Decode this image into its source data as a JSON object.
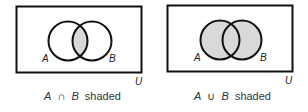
{
  "figure": {
    "shade_color": "#d9d9d9",
    "stroke_color": "#111111",
    "panels": [
      {
        "id": "intersection",
        "set_a_label": "A",
        "set_b_label": "B",
        "universe_label": "U",
        "caption_set_a": "A",
        "caption_operator": "∩",
        "caption_set_b": "B",
        "caption_suffix": "shaded",
        "shaded_region": "A ∩ B"
      },
      {
        "id": "union",
        "set_a_label": "A",
        "set_b_label": "B",
        "universe_label": "U",
        "caption_set_a": "A",
        "caption_operator": "∪",
        "caption_set_b": "B",
        "caption_suffix": "shaded",
        "shaded_region": "A ∪ B"
      }
    ]
  }
}
